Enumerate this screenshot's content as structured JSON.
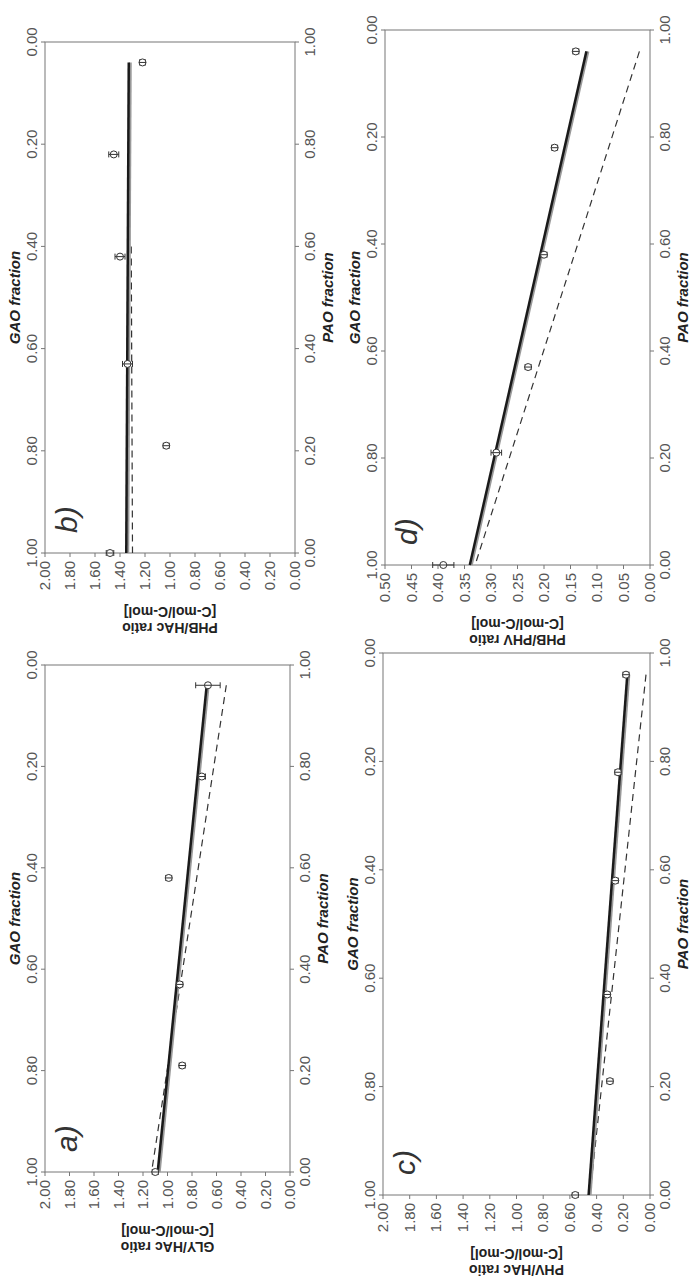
{
  "figure": {
    "orientation": "rotated 90 degrees counter-clockwise",
    "x_axis_bottom_label": "GAO fraction",
    "x_axis_top_label": "PAO fraction",
    "x_ticks_gao": [
      "0.00",
      "0.20",
      "0.40",
      "0.60",
      "0.80",
      "1.00"
    ],
    "x_ticks_pao": [
      "1.00",
      "0.80",
      "0.60",
      "0.40",
      "0.20",
      "0.00"
    ]
  },
  "chart_data": [
    {
      "panel": "a)",
      "type": "scatter",
      "title": "",
      "xlabel": "GAO fraction",
      "xlabel_secondary": "PAO fraction",
      "ylabel": "GLY/HAc ratio [C-mol/C-mol]",
      "ylim": [
        0,
        2
      ],
      "yticks": [
        "0.00",
        "0.20",
        "0.40",
        "0.60",
        "0.80",
        "1.00",
        "1.20",
        "1.40",
        "1.60",
        "1.80",
        "2.00"
      ],
      "xlim": [
        0,
        1
      ],
      "x": [
        0.04,
        0.22,
        0.42,
        0.63,
        0.79,
        1.0
      ],
      "values": [
        0.67,
        0.72,
        0.99,
        0.9,
        0.88,
        1.1
      ],
      "error_bars": [
        0.1,
        0.03,
        0.02,
        0.02,
        0.01,
        0.02
      ],
      "fit_solid": {
        "x": [
          0.04,
          1.0
        ],
        "y": [
          0.68,
          1.08
        ]
      },
      "fit_dashed": {
        "x": [
          0.04,
          1.0
        ],
        "y": [
          0.52,
          1.13
        ]
      }
    },
    {
      "panel": "b)",
      "type": "scatter",
      "title": "",
      "xlabel": "GAO fraction",
      "xlabel_secondary": "PAO fraction",
      "ylabel": "PHB/HAc ratio [C-mol/C-mol]",
      "ylim": [
        0,
        2
      ],
      "yticks": [
        "0.00",
        "0.20",
        "0.40",
        "0.60",
        "0.80",
        "1.00",
        "1.20",
        "1.40",
        "1.60",
        "1.80",
        "2.00"
      ],
      "xlim": [
        0,
        1
      ],
      "x": [
        0.04,
        0.22,
        0.42,
        0.63,
        0.79,
        1.0
      ],
      "values": [
        1.22,
        1.45,
        1.4,
        1.34,
        1.03,
        1.48
      ],
      "error_bars": [
        0.01,
        0.04,
        0.04,
        0.04,
        0.01,
        0.03
      ],
      "fit_solid": {
        "x": [
          0.04,
          1.0
        ],
        "y": [
          1.33,
          1.35
        ]
      },
      "fit_dashed": {
        "x": [
          0.4,
          1.0
        ],
        "y": [
          1.31,
          1.3
        ]
      }
    },
    {
      "panel": "c)",
      "type": "scatter",
      "title": "",
      "xlabel": "GAO fraction",
      "xlabel_secondary": "PAO fraction",
      "ylabel": "PHV/HAc ratio [C-mol/C-mol]",
      "ylim": [
        0,
        2
      ],
      "yticks": [
        "0.00",
        "0.20",
        "0.40",
        "0.60",
        "0.80",
        "1.00",
        "1.20",
        "1.40",
        "1.60",
        "1.80",
        "2.00"
      ],
      "xlim": [
        0,
        1
      ],
      "x": [
        0.04,
        0.22,
        0.42,
        0.63,
        0.79,
        1.0
      ],
      "values": [
        0.18,
        0.24,
        0.26,
        0.32,
        0.3,
        0.56
      ],
      "error_bars": [
        0.01,
        0.01,
        0.01,
        0.01,
        0.01,
        0.01
      ],
      "fit_solid": {
        "x": [
          0.04,
          1.0
        ],
        "y": [
          0.17,
          0.46
        ]
      },
      "fit_dashed": {
        "x": [
          0.04,
          1.0
        ],
        "y": [
          0.03,
          0.45
        ]
      }
    },
    {
      "panel": "d)",
      "type": "scatter",
      "title": "",
      "xlabel": "GAO fraction",
      "xlabel_secondary": "PAO fraction",
      "ylabel": "PHB/PHV ratio [C-mol/C-mol]",
      "ylim": [
        0,
        0.5
      ],
      "yticks": [
        "0.00",
        "0.05",
        "0.10",
        "0.15",
        "0.20",
        "0.25",
        "0.30",
        "0.35",
        "0.40",
        "0.45",
        "0.50"
      ],
      "xlim": [
        0,
        1
      ],
      "x": [
        0.04,
        0.22,
        0.42,
        0.63,
        0.79,
        1.0
      ],
      "values": [
        0.14,
        0.18,
        0.2,
        0.23,
        0.29,
        0.39
      ],
      "error_bars": [
        0.002,
        0.003,
        0.003,
        0.005,
        0.01,
        0.02
      ],
      "fit_solid": {
        "x": [
          0.04,
          1.0
        ],
        "y": [
          0.12,
          0.34
        ]
      },
      "fit_dashed": {
        "x": [
          0.04,
          1.0
        ],
        "y": [
          0.02,
          0.33
        ]
      }
    }
  ],
  "colors": {
    "axis": "#777777",
    "fit_solid": "#1a1a1a",
    "fit_shadow": "#999999",
    "fit_dashed": "#333333",
    "marker": "#333333"
  }
}
